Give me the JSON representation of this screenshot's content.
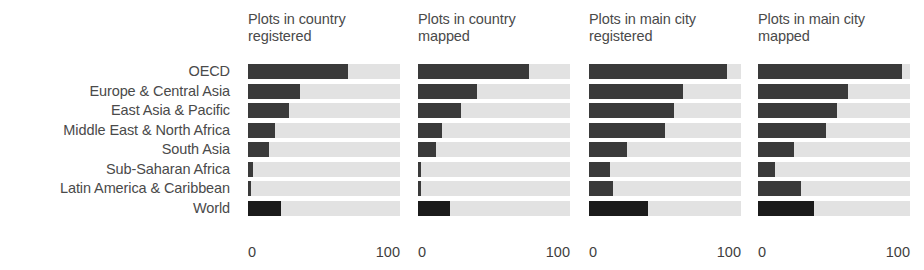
{
  "chart_data": {
    "type": "bar",
    "orientation": "horizontal",
    "title": "",
    "subtitle": "",
    "xlabel": "",
    "ylabel": "",
    "xlim": [
      0,
      100
    ],
    "grid": false,
    "legend": "none",
    "axis_ticks": [
      "0",
      "100"
    ],
    "categories": [
      "OECD",
      "Europe & Central Asia",
      "East Asia & Pacific",
      "Middle East & North Africa",
      "South Asia",
      "Sub-Saharan Africa",
      "Latin America & Caribbean",
      "World"
    ],
    "panels": [
      {
        "title_line1": "Plots in country",
        "title_line2": "registered",
        "values": [
          66,
          34,
          27,
          18,
          14,
          3,
          2,
          22
        ]
      },
      {
        "title_line1": "Plots in country",
        "title_line2": "mapped",
        "values": [
          73,
          39,
          28,
          16,
          12,
          2,
          2,
          21
        ]
      },
      {
        "title_line1": "Plots in main city",
        "title_line2": "registered",
        "values": [
          91,
          62,
          56,
          50,
          25,
          14,
          16,
          39
        ]
      },
      {
        "title_line1": "Plots in main city",
        "title_line2": "mapped",
        "values": [
          95,
          59,
          52,
          45,
          24,
          11,
          28,
          37
        ]
      }
    ],
    "series": [
      {
        "name": "Plots in country registered",
        "values": [
          66,
          34,
          27,
          18,
          14,
          3,
          2,
          22
        ]
      },
      {
        "name": "Plots in country mapped",
        "values": [
          73,
          39,
          28,
          16,
          12,
          2,
          2,
          21
        ]
      },
      {
        "name": "Plots in main city registered",
        "values": [
          91,
          62,
          56,
          50,
          25,
          14,
          16,
          39
        ]
      },
      {
        "name": "Plots in main city mapped",
        "values": [
          95,
          59,
          52,
          45,
          24,
          11,
          28,
          37
        ]
      }
    ],
    "colors": {
      "bar_fill": "#3a3a3a",
      "bar_fill_emphasis": "#1b1b1b",
      "bar_track": "#e2e2e2",
      "text": "#4a4a4a",
      "background": "#ffffff"
    },
    "emphasis_category": "World"
  }
}
